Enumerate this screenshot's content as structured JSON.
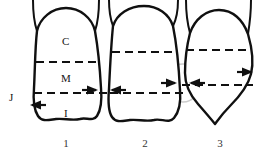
{
  "figure": {
    "kind": "tooth-crown-anatomy-diagram",
    "background_color": "#ffffff",
    "outline_color": "#101010",
    "dashed_line_color": "#101010",
    "highlight_circle_color": "#cccccc",
    "width": 265,
    "height": 158
  },
  "zone_labels": [
    {
      "id": "cervical",
      "text": "C",
      "x": 62,
      "y": 36
    },
    {
      "id": "middle",
      "text": "M",
      "x": 61,
      "y": 73
    },
    {
      "id": "incisal",
      "text": "I",
      "x": 64,
      "y": 108
    },
    {
      "id": "junction",
      "text": "J",
      "x": 9,
      "y": 92
    }
  ],
  "tooth_numbers": [
    {
      "label": "1",
      "x": 66,
      "y": 138
    },
    {
      "label": "2",
      "x": 145,
      "y": 138
    },
    {
      "label": "3",
      "x": 220,
      "y": 138
    }
  ],
  "teeth": [
    {
      "id": "tooth-1",
      "number": "1",
      "crown_shape": "dome-top-scalloped-base",
      "outline_path": "M 37,31 C 40,18 52,8 66,8 C 80,8 92,18 95,31 C 98,48 100,70 101,88 C 102,100 101,110 97,116 C 93,122 86,117 80,119 C 72,121 64,118 56,119 C 48,120 42,122 38,116 C 34,110 33,100 34,88 C 35,70 35,48 37,31 Z",
      "roots": [
        "M 37,31 C 34,22 33,10 33,0",
        "M 95,31 C 98,22 99,10 99,0"
      ],
      "dashed_lines": [
        {
          "id": "cervical-middle-divider",
          "x1": 36,
          "y1": 62,
          "x2": 100,
          "y2": 62
        },
        {
          "id": "middle-incisal-divider",
          "x1": 34,
          "y1": 93,
          "x2": 108,
          "y2": 93
        }
      ]
    },
    {
      "id": "tooth-2",
      "number": "2",
      "crown_shape": "dome-top-scalloped-base",
      "outline_path": "M 113,26 C 117,14 129,6 144,6 C 158,6 169,14 173,26 C 177,46 179,70 180,90 C 181,102 179,112 174,118 C 169,124 161,118 154,120 C 146,122 138,119 130,120 C 122,121 116,123 112,117 C 108,111 108,101 109,89 C 110,68 111,46 113,26 Z",
      "roots": [
        "M 113,26 C 110,18 109,9 109,0",
        "M 173,26 C 177,18 178,9 178,0"
      ],
      "dashed_lines": [
        {
          "id": "cervical-middle-divider",
          "x1": 112,
          "y1": 52,
          "x2": 178,
          "y2": 52
        },
        {
          "id": "middle-incisal-divider",
          "x1": 110,
          "y1": 93,
          "x2": 184,
          "y2": 93
        }
      ]
    },
    {
      "id": "tooth-3",
      "number": "3",
      "crown_shape": "rhomboid-pointed-base",
      "outline_path": "M 190,33 C 195,19 206,10 219,10 C 233,10 243,20 248,34 C 252,48 254,62 251,74 C 248,86 240,96 230,106 C 222,114 218,120 215,124 C 211,119 205,112 198,104 C 190,95 185,85 185,73 C 185,58 187,45 190,33 Z",
      "roots": [
        "M 190,33 C 187,22 186,10 186,0",
        "M 248,34 C 250,22 251,10 251,0"
      ],
      "dashed_lines": [
        {
          "id": "cervical-middle-divider",
          "x1": 186,
          "y1": 50,
          "x2": 250,
          "y2": 50
        },
        {
          "id": "middle-incisal-divider",
          "x1": 182,
          "y1": 85,
          "x2": 253,
          "y2": 85
        }
      ]
    }
  ],
  "contact_points": [
    {
      "id": "contact-1-2",
      "x": 104,
      "y": 90,
      "highlighted": false,
      "arrow_left": {
        "tip_x": 98,
        "tip_y": 90,
        "direction": "right"
      },
      "arrow_right": {
        "tip_x": 110,
        "tip_y": 90,
        "direction": "left"
      }
    },
    {
      "id": "contact-2-3",
      "x": 183,
      "y": 83,
      "highlighted": true,
      "highlight_radius_x": 17,
      "highlight_radius_y": 19,
      "arrow_left": {
        "tip_x": 177,
        "tip_y": 83,
        "direction": "right"
      },
      "arrow_right": {
        "tip_x": 189,
        "tip_y": 83,
        "direction": "left"
      }
    }
  ],
  "edge_arrows": [
    {
      "id": "arrow-tooth1-left",
      "tip_x": 30,
      "tip_y": 105,
      "direction": "left"
    },
    {
      "id": "arrow-tooth3-right",
      "tip_x": 253,
      "tip_y": 72,
      "direction": "right"
    }
  ]
}
